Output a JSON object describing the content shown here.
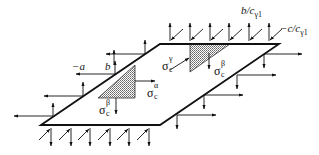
{
  "diagram": {
    "type": "plate-stress-boundary-diagram",
    "colors": {
      "line": "#111111",
      "hatch": "#555555",
      "background": "#ffffff"
    },
    "plate": {
      "corners": [
        [
          41,
          125
        ],
        [
          160,
          44
        ],
        [
          279,
          44
        ],
        [
          160,
          125
        ]
      ]
    },
    "hatched_triangles": [
      {
        "name": "alpha-beta-triangle",
        "points": [
          [
            98,
            98
          ],
          [
            135,
            65
          ],
          [
            135,
            98
          ]
        ]
      },
      {
        "name": "gamma-triangle",
        "points": [
          [
            190,
            44
          ],
          [
            230,
            44
          ],
          [
            190,
            72
          ]
        ]
      }
    ],
    "labels": {
      "minus_a": "−a",
      "b": "b",
      "b_over_c": {
        "main": "b/c",
        "sub": "γ1"
      },
      "minus_c_over_c": {
        "main": "−c/c",
        "sub": "γ1"
      },
      "sigma_gamma": {
        "symbol": "σ",
        "sup": "γ",
        "sub": "c"
      },
      "sigma_alpha": {
        "symbol": "σ",
        "sup": "α",
        "sub": "c"
      },
      "sigma_beta_left": {
        "symbol": "σ",
        "sup": "β",
        "sub": "c"
      },
      "sigma_beta_right": {
        "symbol": "σ",
        "sup": "β",
        "sub": "c"
      }
    }
  }
}
